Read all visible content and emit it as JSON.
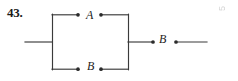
{
  "problem": {
    "number": "43."
  },
  "diagram": {
    "type": "switching-circuit",
    "line_color": "#3a3a3a",
    "node_color": "#2b2b2b",
    "labels": {
      "top_branch": "A",
      "bottom_branch": "B",
      "series_switch": "B"
    },
    "nodes": [
      {
        "name": "top-left-terminal",
        "x": 78,
        "y": 15
      },
      {
        "name": "top-right-terminal",
        "x": 101,
        "y": 15
      },
      {
        "name": "bottom-left-terminal",
        "x": 78,
        "y": 69
      },
      {
        "name": "bottom-right-terminal",
        "x": 101,
        "y": 69
      },
      {
        "name": "series-left-terminal",
        "x": 153,
        "y": 42
      },
      {
        "name": "series-right-terminal",
        "x": 176,
        "y": 42
      }
    ],
    "wires": [
      {
        "name": "left-lead",
        "x1": 25,
        "y1": 42,
        "x2": 52,
        "y2": 42
      },
      {
        "name": "left-bus",
        "x1": 52,
        "y1": 14,
        "x2": 52,
        "y2": 70
      },
      {
        "name": "top-wire-left",
        "x1": 52,
        "y1": 15,
        "x2": 78,
        "y2": 15
      },
      {
        "name": "top-wire-right",
        "x1": 101,
        "y1": 15,
        "x2": 128,
        "y2": 15
      },
      {
        "name": "bottom-wire-left",
        "x1": 52,
        "y1": 69,
        "x2": 78,
        "y2": 69
      },
      {
        "name": "bottom-wire-right",
        "x1": 101,
        "y1": 69,
        "x2": 128,
        "y2": 69
      },
      {
        "name": "right-bus",
        "x1": 128,
        "y1": 14,
        "x2": 128,
        "y2": 70
      },
      {
        "name": "series-lead-left",
        "x1": 128,
        "y1": 42,
        "x2": 153,
        "y2": 42
      },
      {
        "name": "series-lead-right",
        "x1": 176,
        "y1": 42,
        "x2": 207,
        "y2": 42
      }
    ]
  },
  "artifact": {
    "corner_mark": "5"
  }
}
